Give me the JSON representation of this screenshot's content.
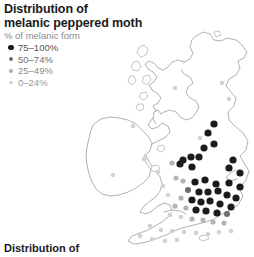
{
  "figure": {
    "title_lines": [
      "Distribution of",
      "melanic peppered moth"
    ],
    "footer_caption": "Distribution of"
  },
  "legend": {
    "heading": "% of melanic form",
    "items": [
      {
        "label": "75–100%",
        "color": "#1c1c1c",
        "size": 3.6
      },
      {
        "label": "50–74%",
        "color": "#6e6e6e",
        "size": 3.0
      },
      {
        "label": "25–49%",
        "color": "#b4b4b4",
        "size": 2.6
      },
      {
        "label": "0–24%",
        "color": "#d2d2d2",
        "size": 2.3
      }
    ]
  },
  "chart_data": {
    "type": "scatter",
    "title": "Distribution of melanic peppered moth",
    "xlabel": "",
    "ylabel": "",
    "legend_position": "top-left",
    "grid": false,
    "variable": "% of melanic form",
    "classes": [
      {
        "name": "75–100%",
        "color": "#1c1c1c",
        "radius": 3.6
      },
      {
        "name": "50–74%",
        "color": "#6e6e6e",
        "radius": 3.0
      },
      {
        "name": "25–49%",
        "color": "#b4b4b4",
        "radius": 2.6
      },
      {
        "name": "0–24%",
        "color": "#d2d2d2",
        "radius": 2.3
      }
    ],
    "points": [
      {
        "x": 229,
        "y": 99,
        "class": 3
      },
      {
        "x": 222,
        "y": 83,
        "class": 3
      },
      {
        "x": 175,
        "y": 88,
        "class": 3
      },
      {
        "x": 214,
        "y": 124,
        "class": 0
      },
      {
        "x": 133,
        "y": 126,
        "class": 3
      },
      {
        "x": 144,
        "y": 159,
        "class": 3
      },
      {
        "x": 113,
        "y": 175,
        "class": 3
      },
      {
        "x": 200,
        "y": 138,
        "class": 3
      },
      {
        "x": 208,
        "y": 133,
        "class": 0
      },
      {
        "x": 214,
        "y": 144,
        "class": 0
      },
      {
        "x": 204,
        "y": 148,
        "class": 0
      },
      {
        "x": 199,
        "y": 157,
        "class": 0
      },
      {
        "x": 191,
        "y": 157,
        "class": 0
      },
      {
        "x": 183,
        "y": 160,
        "class": 0
      },
      {
        "x": 180,
        "y": 164,
        "class": 0
      },
      {
        "x": 172,
        "y": 163,
        "class": 2
      },
      {
        "x": 192,
        "y": 167,
        "class": 0
      },
      {
        "x": 233,
        "y": 160,
        "class": 0
      },
      {
        "x": 229,
        "y": 168,
        "class": 0
      },
      {
        "x": 240,
        "y": 173,
        "class": 0
      },
      {
        "x": 176,
        "y": 178,
        "class": 2
      },
      {
        "x": 183,
        "y": 181,
        "class": 2
      },
      {
        "x": 195,
        "y": 182,
        "class": 0
      },
      {
        "x": 205,
        "y": 180,
        "class": 0
      },
      {
        "x": 216,
        "y": 184,
        "class": 0
      },
      {
        "x": 229,
        "y": 183,
        "class": 0
      },
      {
        "x": 240,
        "y": 187,
        "class": 0
      },
      {
        "x": 188,
        "y": 190,
        "class": 1
      },
      {
        "x": 199,
        "y": 192,
        "class": 0
      },
      {
        "x": 208,
        "y": 192,
        "class": 0
      },
      {
        "x": 218,
        "y": 191,
        "class": 0
      },
      {
        "x": 227,
        "y": 195,
        "class": 0
      },
      {
        "x": 236,
        "y": 198,
        "class": 0
      },
      {
        "x": 181,
        "y": 198,
        "class": 2
      },
      {
        "x": 192,
        "y": 200,
        "class": 0
      },
      {
        "x": 201,
        "y": 202,
        "class": 0
      },
      {
        "x": 210,
        "y": 201,
        "class": 0
      },
      {
        "x": 220,
        "y": 204,
        "class": 0
      },
      {
        "x": 231,
        "y": 207,
        "class": 0
      },
      {
        "x": 175,
        "y": 206,
        "class": 2
      },
      {
        "x": 186,
        "y": 208,
        "class": 2
      },
      {
        "x": 196,
        "y": 210,
        "class": 0
      },
      {
        "x": 206,
        "y": 211,
        "class": 0
      },
      {
        "x": 217,
        "y": 213,
        "class": 0
      },
      {
        "x": 227,
        "y": 214,
        "class": 1
      },
      {
        "x": 170,
        "y": 215,
        "class": 3
      },
      {
        "x": 181,
        "y": 217,
        "class": 3
      },
      {
        "x": 192,
        "y": 219,
        "class": 2
      },
      {
        "x": 203,
        "y": 220,
        "class": 2
      },
      {
        "x": 213,
        "y": 222,
        "class": 2
      },
      {
        "x": 224,
        "y": 223,
        "class": 2
      },
      {
        "x": 150,
        "y": 226,
        "class": 3
      },
      {
        "x": 161,
        "y": 230,
        "class": 3
      },
      {
        "x": 172,
        "y": 231,
        "class": 3
      },
      {
        "x": 184,
        "y": 232,
        "class": 3
      },
      {
        "x": 196,
        "y": 233,
        "class": 3
      },
      {
        "x": 208,
        "y": 234,
        "class": 3
      },
      {
        "x": 219,
        "y": 232,
        "class": 3
      },
      {
        "x": 231,
        "y": 231,
        "class": 3
      },
      {
        "x": 140,
        "y": 236,
        "class": 3
      },
      {
        "x": 152,
        "y": 239,
        "class": 3
      },
      {
        "x": 165,
        "y": 241,
        "class": 3
      },
      {
        "x": 177,
        "y": 240,
        "class": 3
      },
      {
        "x": 158,
        "y": 172,
        "class": 3
      },
      {
        "x": 163,
        "y": 186,
        "class": 3
      },
      {
        "x": 168,
        "y": 195,
        "class": 3
      }
    ]
  }
}
